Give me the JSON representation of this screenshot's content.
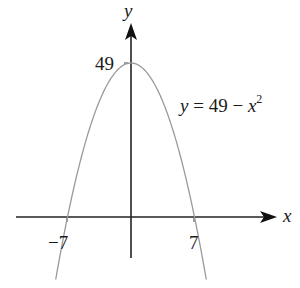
{
  "chart_data": {
    "type": "line",
    "title": "",
    "function": "y = 49 - x^2",
    "equation_label": {
      "lhs": "y",
      "eq": " = 49 − ",
      "var": "x",
      "exp": "2"
    },
    "xlabel": "x",
    "ylabel": "y",
    "x_ticks": [
      {
        "value": -7,
        "label": "−7"
      },
      {
        "value": 7,
        "label": "7"
      }
    ],
    "y_ticks": [
      {
        "value": 49,
        "label": "49"
      }
    ],
    "series": [
      {
        "name": "y = 49 − x²",
        "x": [
          -8.3,
          -7,
          -6,
          -5,
          -4,
          -3,
          -2,
          -1,
          0,
          1,
          2,
          3,
          4,
          5,
          6,
          7,
          8.3
        ],
        "values": [
          -19.9,
          0,
          13,
          24,
          33,
          40,
          45,
          48,
          49,
          48,
          45,
          40,
          33,
          24,
          13,
          0,
          -19.9
        ]
      }
    ],
    "xlim": [
      -11.5,
      16
    ],
    "ylim": [
      -21,
      61
    ],
    "grid": false,
    "legend": "none",
    "colors": {
      "curve": "#9a9a9a",
      "axes": "#222222"
    }
  }
}
